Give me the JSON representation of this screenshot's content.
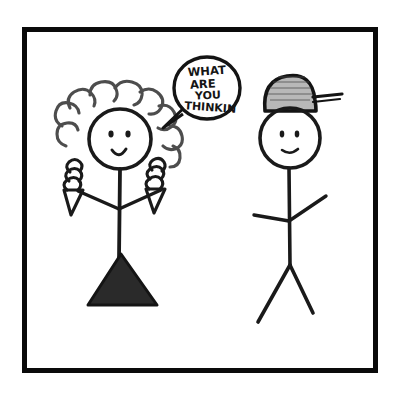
{
  "scene": {
    "title": "Stick figure cartoon drawing",
    "background_color": "#ffffff",
    "ink_color": "#1a1a1a",
    "frame": {
      "name": "border-frame",
      "x": 22,
      "y": 27,
      "width": 356,
      "height": 346,
      "thickness": 5,
      "color": "#000000"
    },
    "speech_bubble": {
      "name": "speech-bubble",
      "lines": [
        "WHAT",
        "ARE",
        "YOU",
        "THINKIN"
      ],
      "full_text": "WHAT ARE YOU THINKIN",
      "center_x": 207,
      "center_y": 88,
      "radius_x": 33,
      "radius_y": 32,
      "tail_direction": "down-left",
      "speaker": "right-figure"
    },
    "figures": [
      {
        "name": "left-figure",
        "description": "stick figure with curly hair, triangular dress and mitten hands",
        "hair": "curly",
        "body_shape": "triangle-dress",
        "expression": "smile",
        "head_center_x": 120,
        "head_center_y": 139,
        "head_radius": 31
      },
      {
        "name": "right-figure",
        "description": "stick figure wearing a baseball cap with brim to the right",
        "hat": "baseball-cap",
        "body_shape": "stick",
        "expression": "smile",
        "head_center_x": 290,
        "head_center_y": 137,
        "head_radius": 31
      }
    ]
  }
}
